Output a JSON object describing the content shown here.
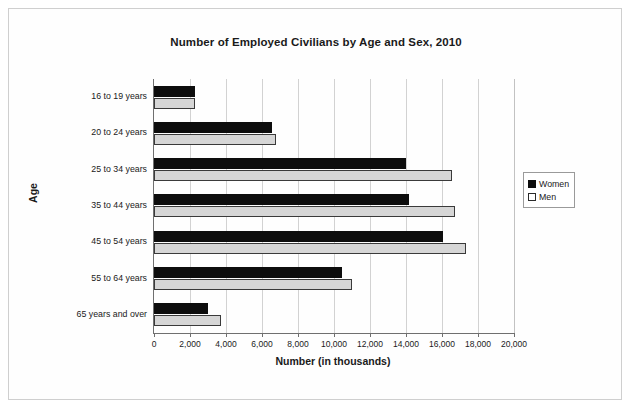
{
  "chart_data": {
    "type": "bar",
    "orientation": "horizontal",
    "title": "Number of Employed Civilians by Age and Sex, 2010",
    "xlabel": "Number (in thousands)",
    "ylabel": "Age",
    "categories": [
      "16 to 19 years",
      "20 to 24 years",
      "25 to 34 years",
      "35 to 44 years",
      "45 to 54 years",
      "55 to 64 years",
      "65 years and over"
    ],
    "series": [
      {
        "name": "Women",
        "color": "#0d0d0d",
        "values": [
          2250,
          6550,
          14000,
          14150,
          16050,
          10450,
          3000
        ]
      },
      {
        "name": "Men",
        "color": "#d6d6d6",
        "values": [
          2250,
          6800,
          16550,
          16700,
          17350,
          11000,
          3700
        ]
      }
    ],
    "xlim": [
      0,
      20000
    ],
    "xticks": [
      0,
      2000,
      4000,
      6000,
      8000,
      10000,
      12000,
      14000,
      16000,
      18000,
      20000
    ],
    "xtick_labels": [
      "0",
      "2,000",
      "4,000",
      "6,000",
      "8,000",
      "10,000",
      "12,000",
      "14,000",
      "16,000",
      "18,000",
      "20,000"
    ],
    "grid": "vertical",
    "legend_position": "right"
  }
}
